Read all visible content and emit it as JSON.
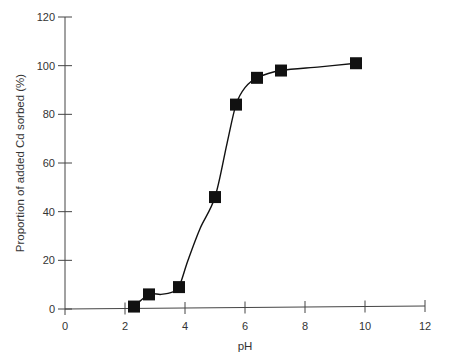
{
  "chart_data": {
    "type": "line",
    "title": "",
    "xlabel": "pH",
    "ylabel": "Proportion of added Cd sorbed (%)",
    "xlim": [
      0,
      12
    ],
    "ylim": [
      0,
      120
    ],
    "xticks": [
      0,
      2,
      4,
      6,
      8,
      10,
      12
    ],
    "yticks": [
      0,
      20,
      40,
      60,
      80,
      100,
      120
    ],
    "grid": false,
    "legend": null,
    "series": [
      {
        "name": "Cd sorbed",
        "marker": "square",
        "color": "#111111",
        "x": [
          2.3,
          2.8,
          3.8,
          5.0,
          5.7,
          6.4,
          7.2,
          9.7
        ],
        "y": [
          1,
          6,
          9,
          46,
          84,
          95,
          98,
          101
        ]
      }
    ],
    "curve": {
      "description": "smooth fitted curve through points",
      "x": [
        2.3,
        2.8,
        3.2,
        3.6,
        3.8,
        4.1,
        4.5,
        5.0,
        5.4,
        5.7,
        6.0,
        6.4,
        7.2,
        8.5,
        9.7
      ],
      "y": [
        1,
        6,
        6,
        7,
        9,
        20,
        33,
        46,
        68,
        84,
        91,
        95,
        98,
        99.5,
        101
      ]
    }
  }
}
